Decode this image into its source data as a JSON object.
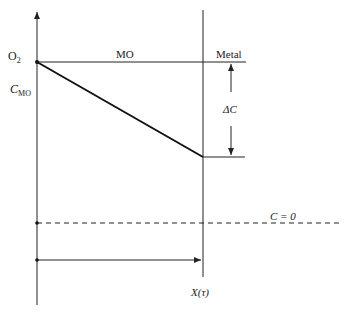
{
  "diagram": {
    "labels": {
      "oxygen": "O",
      "oxygen_sub": "2",
      "concentration_oxide": "C",
      "concentration_oxide_sub": "MO",
      "oxide_region": "MO",
      "metal_region": "Metal",
      "delta_c": "ΔC",
      "zero_concentration": "C = 0",
      "thickness": "X(τ)"
    },
    "colors": {
      "line": "#222222",
      "profile": "#111111",
      "background": "#ffffff"
    }
  }
}
